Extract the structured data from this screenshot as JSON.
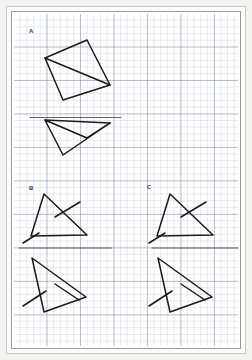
{
  "document": {
    "kind": "graph-paper-worksheet",
    "background_color": "#ffffff",
    "page_border_color": "#9a9a98",
    "grid_minor_color": "#96a0af",
    "grid_major_color": "#7882960",
    "ink_color": "#1a1a1a"
  },
  "labels": {
    "a": "A",
    "b": "B",
    "c": "C"
  },
  "exercises": [
    {
      "id": "a",
      "label": "A",
      "mirror_line": {
        "x1": 30,
        "y1": 117.5,
        "x2": 121,
        "y2": 117.5
      },
      "original": {
        "name": "quadrilateral-with-diagonal",
        "polygon": [
          [
            45,
            58
          ],
          [
            87,
            40
          ],
          [
            110,
            85
          ],
          [
            63,
            100
          ]
        ],
        "extra_segments": [
          [
            [
              45,
              58
            ],
            [
              110,
              85
            ]
          ]
        ]
      },
      "reflection": {
        "name": "quadrilateral-with-diagonal-reflected",
        "polygon": [
          [
            45,
            120
          ],
          [
            87,
            138
          ],
          [
            110,
            123
          ],
          [
            63,
            155
          ]
        ],
        "extra_segments": [
          [
            [
              45,
              120
            ],
            [
              110,
              123
            ]
          ]
        ]
      }
    },
    {
      "id": "b",
      "label": "B",
      "mirror_line": {
        "x1": 19,
        "y1": 248,
        "x2": 112,
        "y2": 248
      },
      "original": {
        "name": "triangle-with-tick-marks",
        "polygon": [
          [
            44,
            194
          ],
          [
            87,
            235
          ],
          [
            31,
            236
          ]
        ],
        "extra_segments": [
          [
            [
              55,
              217
            ],
            [
              80,
              202
            ]
          ],
          [
            [
              23,
              243
            ],
            [
              39,
              233
            ]
          ]
        ]
      },
      "reflection": {
        "name": "triangle-with-tick-marks-reflected",
        "polygon": [
          [
            32,
            258
          ],
          [
            86,
            297
          ],
          [
            44,
            312
          ]
        ],
        "extra_segments": [
          [
            [
              55,
              284
            ],
            [
              79,
              300
            ]
          ],
          [
            [
              23,
              306
            ],
            [
              46,
              291
            ]
          ]
        ]
      }
    },
    {
      "id": "c",
      "label": "C",
      "mirror_line": {
        "x1": 152,
        "y1": 248,
        "x2": 238,
        "y2": 248
      },
      "original": {
        "name": "triangle-with-tick-marks",
        "polygon": [
          [
            170,
            194
          ],
          [
            213,
            235
          ],
          [
            157,
            236
          ]
        ],
        "extra_segments": [
          [
            [
              181,
              217
            ],
            [
              206,
              202
            ]
          ],
          [
            [
              149,
              243
            ],
            [
              165,
              233
            ]
          ]
        ]
      },
      "reflection": {
        "name": "triangle-with-tick-marks-reflected",
        "polygon": [
          [
            158,
            258
          ],
          [
            212,
            297
          ],
          [
            170,
            312
          ]
        ],
        "extra_segments": [
          [
            [
              181,
              284
            ],
            [
              205,
              300
            ]
          ],
          [
            [
              149,
              306
            ],
            [
              172,
              291
            ]
          ]
        ]
      }
    }
  ]
}
